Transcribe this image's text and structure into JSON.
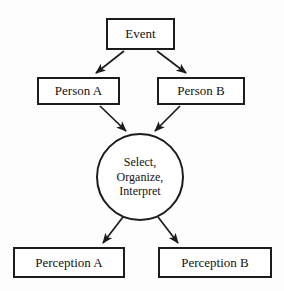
{
  "diagram": {
    "background_color": "#fdfdfd",
    "stroke_color": "#1c1c1c",
    "text_color": "#111111",
    "nodes": {
      "event": {
        "label": "Event",
        "shape": "rectangle"
      },
      "person_a": {
        "label": "Person A",
        "shape": "rectangle"
      },
      "person_b": {
        "label": "Person B",
        "shape": "rectangle"
      },
      "process": {
        "shape": "circle",
        "lines": [
          "Select,",
          "Organize,",
          "Interpret"
        ]
      },
      "perception_a": {
        "label": "Perception A",
        "shape": "rectangle"
      },
      "perception_b": {
        "label": "Perception B",
        "shape": "rectangle"
      }
    },
    "edges": [
      {
        "from": "event",
        "to": "person_a",
        "style": "solid",
        "arrowhead": "filled"
      },
      {
        "from": "event",
        "to": "person_b",
        "style": "solid",
        "arrowhead": "filled"
      },
      {
        "from": "person_a",
        "to": "process",
        "style": "solid",
        "arrowhead": "filled"
      },
      {
        "from": "person_b",
        "to": "process",
        "style": "solid",
        "arrowhead": "filled"
      },
      {
        "from": "process",
        "to": "perception_a",
        "style": "solid",
        "arrowhead": "filled"
      },
      {
        "from": "process",
        "to": "perception_b",
        "style": "solid",
        "arrowhead": "filled"
      }
    ]
  }
}
